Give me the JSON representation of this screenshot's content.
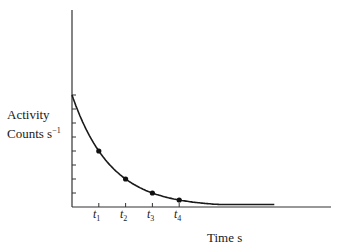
{
  "chart_data": {
    "type": "line",
    "title": "",
    "xlabel": "Time s",
    "ylabel": "Activity Counts s^-1",
    "ylabel_lines": [
      "Activity",
      "Counts s",
      "−1"
    ],
    "x_tick_labels": [
      "t1",
      "t2",
      "t3",
      "t4"
    ],
    "x_tick_labels_parts": [
      {
        "base": "t",
        "sub": "1"
      },
      {
        "base": "t",
        "sub": "2"
      },
      {
        "base": "t",
        "sub": "3"
      },
      {
        "base": "t",
        "sub": "4"
      }
    ],
    "y_ticks_count": 8,
    "y_tick_labels": [],
    "series": [
      {
        "name": "Activity decay curve",
        "x": [
          0,
          1,
          2,
          3,
          4
        ],
        "x_labels": [
          "0",
          "t1",
          "t2",
          "t3",
          "t4"
        ],
        "values": [
          8,
          4,
          2,
          1,
          0.5
        ],
        "markers_at": [
          "t1",
          "t2",
          "t3",
          "t4"
        ]
      }
    ],
    "curve_shape": "exponential decay (halving each interval), approaches zero asymptotically",
    "ylim": [
      0,
      14
    ],
    "xlim": [
      0,
      9.5
    ],
    "grid": false,
    "legend": "none"
  },
  "labels": {
    "y_line1": "Activity",
    "y_line2": "Counts s",
    "y_sup": "−1",
    "x": "Time s",
    "t_base": "t",
    "t1": "1",
    "t2": "2",
    "t3": "3",
    "t4": "4"
  }
}
